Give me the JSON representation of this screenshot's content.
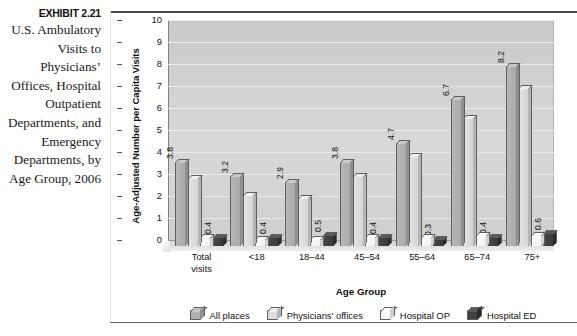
{
  "exhibit": {
    "number": "EXHIBIT 2.21",
    "title": "U.S. Ambulatory Visits to Physicians’ Offices, Hospital Outpatient Departments, and Emergency Departments, by Age Group, 2006"
  },
  "chart_data": {
    "type": "bar",
    "title": "",
    "xlabel": "Age Group",
    "ylabel": "Age-Adjusted Number per Capita Visits",
    "ylim": [
      0,
      10
    ],
    "yticks": [
      0,
      1,
      2,
      3,
      4,
      5,
      6,
      7,
      8,
      9,
      10
    ],
    "ytick_labels": [
      "0",
      "1",
      "2",
      "3",
      "4",
      "5",
      "6",
      "7",
      "8",
      "9",
      "10"
    ],
    "grid": true,
    "legend_position": "bottom",
    "categories": [
      "Total visits",
      "<18",
      "18–44",
      "45–54",
      "55–64",
      "65–74",
      "75+"
    ],
    "category_lines": [
      [
        "Total",
        "visits"
      ],
      [
        "<18",
        ""
      ],
      [
        "18–44",
        ""
      ],
      [
        "45–54",
        ""
      ],
      [
        "55–64",
        ""
      ],
      [
        "65–74",
        ""
      ],
      [
        "75+",
        ""
      ]
    ],
    "series": [
      {
        "name": "All places",
        "color": "#b0b0b0",
        "values": [
          3.8,
          3.2,
          2.9,
          3.8,
          4.7,
          6.7,
          8.2
        ]
      },
      {
        "name": "Physicians' offices",
        "color": "#dcdcdc",
        "values": [
          3.1,
          2.3,
          2.2,
          3.2,
          4.1,
          5.8,
          7.2
        ]
      },
      {
        "name": "Hospital OP",
        "color": "#f8f8f8",
        "values": [
          0.4,
          0.3,
          0.3,
          0.4,
          0.4,
          0.5,
          0.5
        ]
      },
      {
        "name": "Hospital ED",
        "color": "#404040",
        "values": [
          0.4,
          0.4,
          0.5,
          0.4,
          0.3,
          0.4,
          0.6
        ]
      }
    ]
  }
}
